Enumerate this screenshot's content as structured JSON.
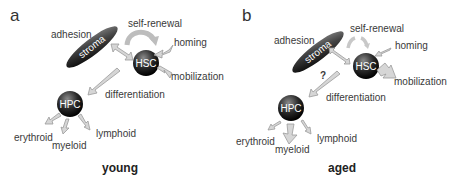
{
  "panels": [
    {
      "letter": "a",
      "condition": "young",
      "labels": {
        "adhesion": "adhesion",
        "stroma": "stroma",
        "self_renewal": "self-renewal",
        "homing": "homing",
        "hsc": "HSC",
        "mobilization": "mobilization",
        "hpc": "HPC",
        "differentiation": "differentiation",
        "erythroid": "erythroid",
        "myeloid": "myeloid",
        "lymphoid": "lymphoid"
      }
    },
    {
      "letter": "b",
      "condition": "aged",
      "question_mark": "?",
      "labels": {
        "adhesion": "adhesion",
        "stroma": "stroma",
        "self_renewal": "self-renewal",
        "homing": "homing",
        "hsc": "HSC",
        "mobilization": "mobilization",
        "hpc": "HPC",
        "differentiation": "differentiation",
        "erythroid": "erythroid",
        "myeloid": "myeloid",
        "lymphoid": "lymphoid"
      }
    }
  ]
}
